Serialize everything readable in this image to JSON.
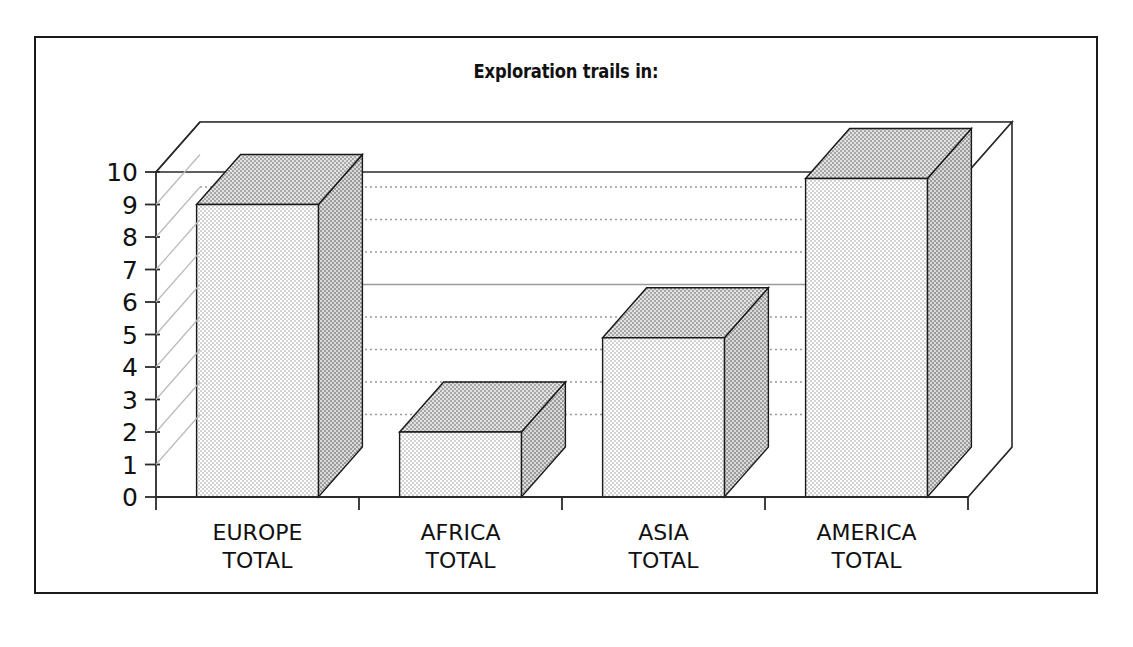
{
  "figure": {
    "border_color": "#1a1a1a",
    "background": "#ffffff"
  },
  "chart_data": {
    "type": "bar",
    "title": "Exploration trails in:",
    "xlabel": "",
    "ylabel": "",
    "ylim": [
      0,
      10
    ],
    "grid": true,
    "legend": "none",
    "style": "3d-bar",
    "categories": [
      "EUROPE TOTAL",
      "AFRICA TOTAL",
      "ASIA TOTAL",
      "AMERICA TOTAL"
    ],
    "category_lines": [
      [
        "EUROPE",
        "TOTAL"
      ],
      [
        "AFRICA",
        "TOTAL"
      ],
      [
        "ASIA",
        "TOTAL"
      ],
      [
        "AMERICA",
        "TOTAL"
      ]
    ],
    "values": [
      9,
      2,
      4.9,
      9.8
    ],
    "ytick_labels": [
      "10",
      "9",
      "8",
      "7",
      "6",
      "5",
      "4",
      "3",
      "2",
      "1",
      "0"
    ],
    "ytick_values": [
      10,
      9,
      8,
      7,
      6,
      5,
      4,
      3,
      2,
      1,
      0
    ],
    "colors": {
      "bar_front": "#e4e4e4",
      "bar_side": "#b4b4b4",
      "bar_top": "#c0c0c0",
      "bar_edge": "#1a1a1a",
      "floor_wedge": "#9a9a9a",
      "gridline": "#9a9a9a",
      "axis": "#2a2a2a"
    }
  }
}
